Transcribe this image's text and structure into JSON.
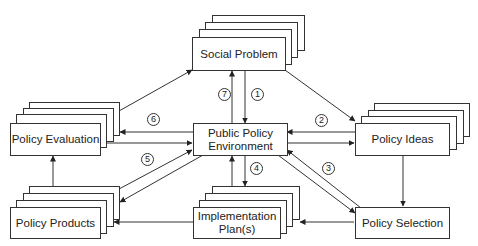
{
  "diagram": {
    "nodes": {
      "social_problem": {
        "label": "Social Problem"
      },
      "public_policy_environment": {
        "line1": "Public Policy",
        "line2": "Environment"
      },
      "policy_evaluation": {
        "label": "Policy Evaluation"
      },
      "policy_ideas": {
        "label": "Policy Ideas"
      },
      "policy_products": {
        "label": "Policy Products"
      },
      "implementation_plans": {
        "line1": "Implementation",
        "line2": "Plan(s)"
      },
      "policy_selection": {
        "label": "Policy Selection"
      }
    },
    "step_labels": [
      "1",
      "2",
      "3",
      "4",
      "5",
      "6",
      "7"
    ]
  }
}
